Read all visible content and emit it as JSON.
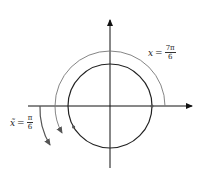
{
  "diagram": {
    "type": "unit-circle-angle",
    "labels": {
      "x_label": {
        "var": "x",
        "eq": "=",
        "numerator": "7π",
        "denominator": "6"
      },
      "xt_label": {
        "var": "x̃",
        "eq": "=",
        "numerator": "π",
        "denominator": "6"
      }
    },
    "colors": {
      "circle": "#222222",
      "arc": "#777777",
      "axes": "#111111"
    }
  }
}
